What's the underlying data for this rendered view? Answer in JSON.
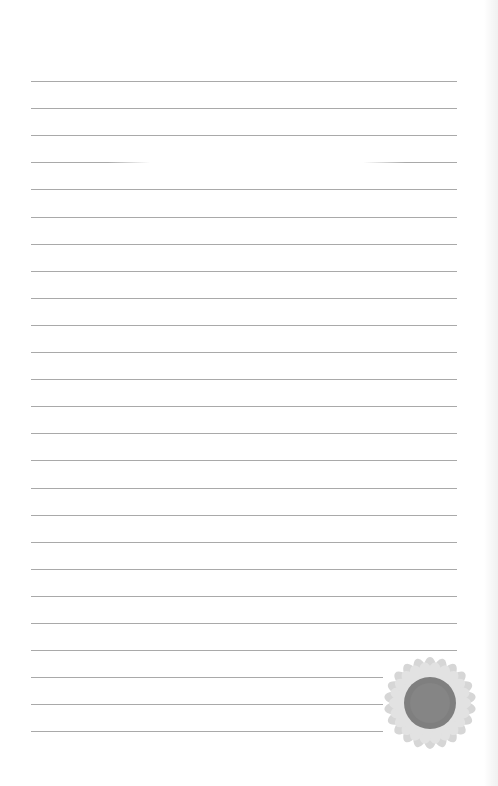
{
  "page": {
    "type": "lined-notepaper",
    "background": "#ffffff",
    "line_color": "#a9a9a9",
    "line_count": 25,
    "first_line_y": 81,
    "line_spacing": 27.1,
    "line_left": 31,
    "line_right_full": 457,
    "line_right_short": 383,
    "short_line_indices": [
      22,
      23,
      24
    ],
    "faded_line_index": 3
  },
  "decoration": {
    "icon": "sunflower-icon",
    "center_x": 430,
    "center_y": 703,
    "disk_radius": 26,
    "petal_radius": 44,
    "disk_color": "#7f7f7f",
    "petal_color": "#d6d6d6"
  }
}
